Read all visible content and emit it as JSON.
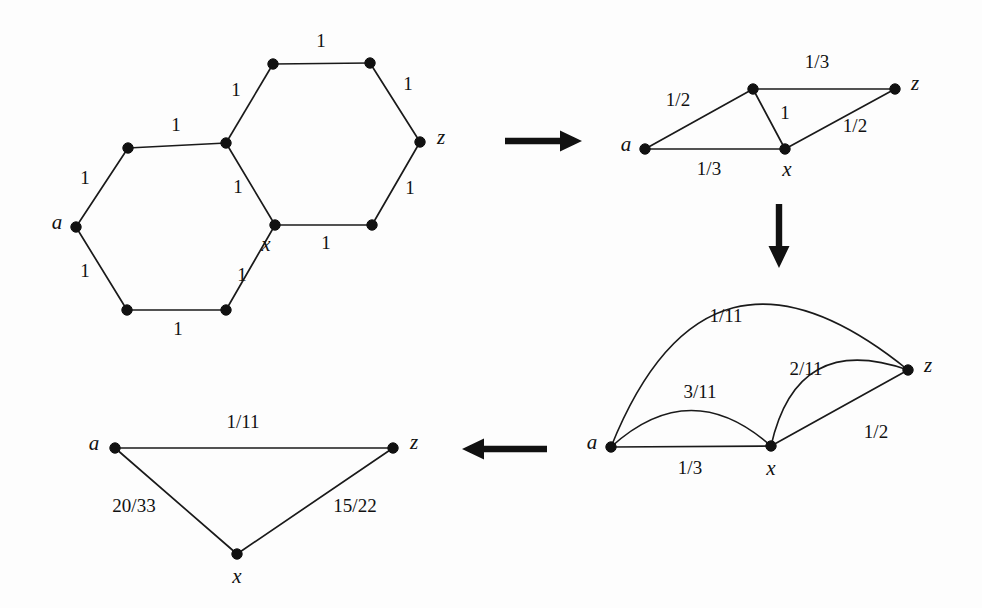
{
  "figure": {
    "background_color": "#fdfdfd",
    "ink_color": "#111111",
    "width": 982,
    "height": 608
  },
  "chart_data": {
    "type": "diagram",
    "panels": [
      {
        "id": "panel-1",
        "name": "double-hexagon-graph",
        "position": "top-left",
        "vertices": [
          {
            "id": "a",
            "label": "a",
            "x": 76,
            "y": 227,
            "label_dx": -19,
            "label_dy": -3
          },
          {
            "id": "v1",
            "label": "",
            "x": 128,
            "y": 148,
            "label_dx": 0,
            "label_dy": 0
          },
          {
            "id": "v2",
            "label": "",
            "x": 226,
            "y": 143,
            "label_dx": 0,
            "label_dy": 0
          },
          {
            "id": "v3",
            "label": "",
            "x": 273,
            "y": 64,
            "label_dx": 0,
            "label_dy": 0
          },
          {
            "id": "v4",
            "label": "",
            "x": 370,
            "y": 63,
            "label_dx": 0,
            "label_dy": 0
          },
          {
            "id": "z",
            "label": "z",
            "x": 420,
            "y": 142,
            "label_dx": 21,
            "label_dy": -3
          },
          {
            "id": "v5",
            "label": "",
            "x": 372,
            "y": 225,
            "label_dx": 0,
            "label_dy": 0
          },
          {
            "id": "x",
            "label": "x",
            "x": 275,
            "y": 225,
            "label_dx": -9,
            "label_dy": 21
          },
          {
            "id": "v6",
            "label": "",
            "x": 226,
            "y": 310,
            "label_dx": 0,
            "label_dy": 0
          },
          {
            "id": "v7",
            "label": "",
            "x": 127,
            "y": 310,
            "label_dx": 0,
            "label_dy": 0
          }
        ],
        "edges": [
          {
            "from": "a",
            "to": "v1",
            "weight": "1",
            "lx": 85,
            "ly": 180
          },
          {
            "from": "v1",
            "to": "v2",
            "weight": "1",
            "lx": 176,
            "ly": 127
          },
          {
            "from": "v2",
            "to": "v3",
            "weight": "1",
            "lx": 236,
            "ly": 92
          },
          {
            "from": "v3",
            "to": "v4",
            "weight": "1",
            "lx": 321,
            "ly": 43
          },
          {
            "from": "v4",
            "to": "z",
            "weight": "1",
            "lx": 408,
            "ly": 86
          },
          {
            "from": "z",
            "to": "v5",
            "weight": "1",
            "lx": 410,
            "ly": 190
          },
          {
            "from": "v5",
            "to": "x",
            "weight": "1",
            "lx": 326,
            "ly": 245
          },
          {
            "from": "x",
            "to": "v2",
            "weight": "1",
            "lx": 238,
            "ly": 189
          },
          {
            "from": "x",
            "to": "v6",
            "weight": "1",
            "lx": 242,
            "ly": 277
          },
          {
            "from": "v6",
            "to": "v7",
            "weight": "1",
            "lx": 178,
            "ly": 331
          },
          {
            "from": "v7",
            "to": "a",
            "weight": "1",
            "lx": 85,
            "ly": 273
          }
        ],
        "curved_edges": []
      },
      {
        "id": "panel-2",
        "name": "four-vertex-graph",
        "position": "top-right",
        "vertices": [
          {
            "id": "a",
            "label": "a",
            "x": 645,
            "y": 149,
            "label_dx": -19,
            "label_dy": -3
          },
          {
            "id": "t",
            "label": "",
            "x": 753,
            "y": 89,
            "label_dx": 0,
            "label_dy": 0
          },
          {
            "id": "x",
            "label": "x",
            "x": 785,
            "y": 149,
            "label_dx": 2,
            "label_dy": 22
          },
          {
            "id": "z",
            "label": "z",
            "x": 895,
            "y": 89,
            "label_dx": 20,
            "label_dy": -4
          }
        ],
        "edges": [
          {
            "from": "a",
            "to": "t",
            "weight": "1/2",
            "lx": 678,
            "ly": 102
          },
          {
            "from": "t",
            "to": "z",
            "weight": "1/3",
            "lx": 817,
            "ly": 64
          },
          {
            "from": "t",
            "to": "x",
            "weight": "1",
            "lx": 785,
            "ly": 115
          },
          {
            "from": "a",
            "to": "x",
            "weight": "1/3",
            "lx": 709,
            "ly": 171
          },
          {
            "from": "x",
            "to": "z",
            "weight": "1/2",
            "lx": 855,
            "ly": 128
          }
        ],
        "curved_edges": []
      },
      {
        "id": "panel-3",
        "name": "multigraph-with-parallel-arcs",
        "position": "bottom-right",
        "vertices": [
          {
            "id": "a",
            "label": "a",
            "x": 611,
            "y": 447,
            "label_dx": -19,
            "label_dy": -3
          },
          {
            "id": "x",
            "label": "x",
            "x": 771,
            "y": 446,
            "label_dx": 0,
            "label_dy": 24
          },
          {
            "id": "z",
            "label": "z",
            "x": 908,
            "y": 370,
            "label_dx": 20,
            "label_dy": -3
          }
        ],
        "edges": [
          {
            "from": "a",
            "to": "x",
            "weight": "1/3",
            "lx": 690,
            "ly": 470
          },
          {
            "from": "x",
            "to": "z",
            "weight": "1/2",
            "lx": 876,
            "ly": 434
          }
        ],
        "curved_edges": [
          {
            "from": "a",
            "to": "z",
            "weight": "1/11",
            "bulge": 104,
            "lx": 726,
            "ly": 318
          },
          {
            "from": "x",
            "to": "z",
            "weight": "2/11",
            "bulge": 44,
            "lx": 806,
            "ly": 371
          },
          {
            "from": "a",
            "to": "x",
            "weight": "3/11",
            "bulge": 36,
            "lx": 700,
            "ly": 394
          }
        ]
      },
      {
        "id": "panel-4",
        "name": "triangle-graph",
        "position": "bottom-left",
        "vertices": [
          {
            "id": "a",
            "label": "a",
            "x": 115,
            "y": 448,
            "label_dx": -21,
            "label_dy": -3
          },
          {
            "id": "z",
            "label": "z",
            "x": 393,
            "y": 448,
            "label_dx": 21,
            "label_dy": -4
          },
          {
            "id": "x",
            "label": "x",
            "x": 237,
            "y": 554,
            "label_dx": 0,
            "label_dy": 24
          }
        ],
        "edges": [
          {
            "from": "a",
            "to": "z",
            "weight": "1/11",
            "lx": 243,
            "ly": 424
          },
          {
            "from": "a",
            "to": "x",
            "weight": "20/33",
            "lx": 134,
            "ly": 508
          },
          {
            "from": "x",
            "to": "z",
            "weight": "15/22",
            "lx": 355,
            "ly": 508
          }
        ],
        "curved_edges": []
      }
    ],
    "arrows": [
      {
        "id": "arrow-1",
        "name": "arrow-right-top",
        "direction": "right",
        "x1": 505,
        "y1": 141,
        "x2": 582,
        "y2": 141
      },
      {
        "id": "arrow-2",
        "name": "arrow-down-right",
        "direction": "down",
        "x1": 779,
        "y1": 204,
        "x2": 779,
        "y2": 268
      },
      {
        "id": "arrow-3",
        "name": "arrow-left-bottom",
        "direction": "left",
        "x1": 547,
        "y1": 449,
        "x2": 462,
        "y2": 449
      }
    ]
  }
}
